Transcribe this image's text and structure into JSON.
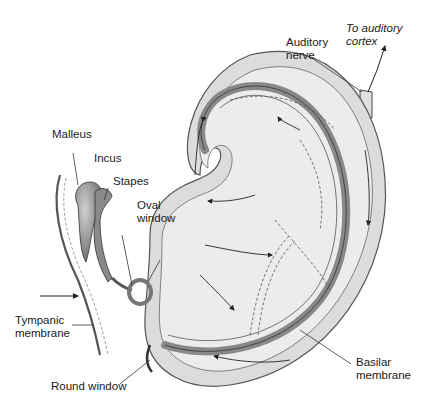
{
  "figure": {
    "labels": {
      "to_cortex": "To auditory\ncortex",
      "auditory_nerve": "Auditory\nnerve",
      "malleus": "Malleus",
      "incus": "Incus",
      "stapes": "Stapes",
      "oval_window": "Oval\nwindow",
      "tympanic_membrane": "Tympanic\nmembrane",
      "round_window": "Round window",
      "basilar_membrane": "Basilar\nmembrane"
    },
    "colors": {
      "bone": "#d9d9d9",
      "fluid": "#e8e8e8",
      "membrane": "#8a8a8a",
      "ossicle": "#9a9a9a",
      "line": "#333333"
    }
  }
}
